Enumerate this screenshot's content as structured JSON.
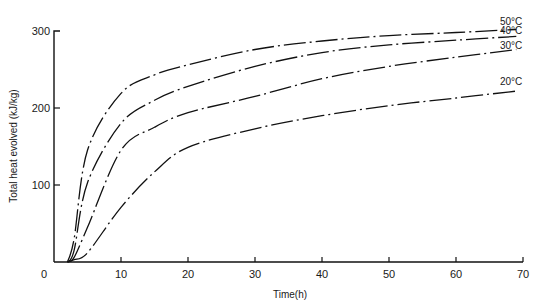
{
  "chart_data": {
    "type": "line",
    "title": "",
    "xlabel": "Time(h)",
    "ylabel": "Total heat evolved (kJ/kg)",
    "xlim": [
      0,
      70
    ],
    "ylim": [
      0,
      300
    ],
    "xticks": [
      0,
      10,
      20,
      30,
      40,
      50,
      60,
      70
    ],
    "yticks": [
      100,
      200,
      300
    ],
    "xtick_labels": [
      "0",
      "10",
      "20",
      "30",
      "40",
      "50",
      "60",
      "70"
    ],
    "ytick_labels": [
      "100",
      "200",
      "300"
    ],
    "grid": false,
    "legend": "inline labels at right end of curves",
    "line_style": "dash-dot",
    "series": [
      {
        "name": "50°C",
        "x": [
          2,
          3,
          5,
          10,
          15,
          20,
          30,
          40,
          50,
          60,
          69
        ],
        "values": [
          0,
          30,
          145,
          219,
          243,
          256,
          276,
          287,
          294,
          298,
          302
        ]
      },
      {
        "name": "40°C",
        "x": [
          2,
          3,
          5,
          10,
          15,
          20,
          30,
          40,
          50,
          60,
          69
        ],
        "values": [
          0,
          15,
          103,
          180,
          210,
          228,
          254,
          272,
          282,
          288,
          293
        ]
      },
      {
        "name": "30°C",
        "x": [
          2,
          3,
          5,
          10,
          15,
          20,
          30,
          40,
          50,
          60,
          69
        ],
        "values": [
          0,
          6,
          45,
          145,
          175,
          194,
          215,
          238,
          254,
          266,
          276
        ]
      },
      {
        "name": "20°C",
        "x": [
          2,
          3,
          5,
          10,
          15,
          20,
          30,
          40,
          50,
          60,
          69
        ],
        "values": [
          0,
          3,
          12,
          71,
          117,
          149,
          173,
          190,
          203,
          213,
          222
        ]
      }
    ]
  },
  "axes": {
    "x_title": "Time(h)",
    "y_title": "Total heat evolved (kJ/kg)"
  }
}
